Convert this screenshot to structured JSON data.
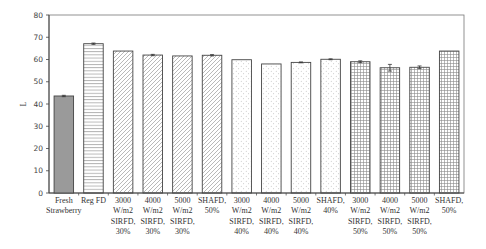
{
  "chart_data": {
    "type": "bar",
    "title": "",
    "xlabel": "",
    "ylabel": "L",
    "ylim": [
      0,
      80
    ],
    "yticks": [
      0,
      10,
      20,
      30,
      40,
      50,
      60,
      70,
      80
    ],
    "grid": false,
    "legend": null,
    "categories": [
      "Fresh Strawberry",
      "Reg FD",
      "3000 W/m2 SIRFD, 30%",
      "4000 W/m2 SIRFD, 30%",
      "5000 W/m2 SIRFD, 30%",
      "SHAFD, 50%",
      "3000 W/m2 SIRFD, 40%",
      "4000 W/m2 SIRFD, 40%",
      "5000 W/m2 SIRFD, 40%",
      "SHAFD, 40%",
      "3000 W/m2 SIRFD, 50%",
      "4000 W/m2 SIRFD, 50%",
      "5000 W/m2 SIRFD, 50%",
      "SHAFD, 50%"
    ],
    "category_lines": [
      [
        "Fresh",
        "Strawberry"
      ],
      [
        "Reg FD"
      ],
      [
        "3000",
        "W/m2",
        "SIRFD,",
        "30%"
      ],
      [
        "4000",
        "W/m2",
        "SIRFD,",
        "30%"
      ],
      [
        "5000",
        "W/m2",
        "SIRFD,",
        "30%"
      ],
      [
        "SHAFD,",
        "50%"
      ],
      [
        "3000",
        "W/m2",
        "SIRFD,",
        "40%"
      ],
      [
        "4000",
        "W/m2",
        "SIRFD,",
        "40%"
      ],
      [
        "5000",
        "W/m2",
        "SIRFD,",
        "40%"
      ],
      [
        "SHAFD,",
        "40%"
      ],
      [
        "3000",
        "W/m2",
        "SIRFD,",
        "50%"
      ],
      [
        "4000",
        "W/m2",
        "SIRFD,",
        "50%"
      ],
      [
        "5000",
        "W/m2",
        "SIRFD,",
        "50%"
      ],
      [
        "SHAFD,",
        "50%"
      ]
    ],
    "values": [
      43.6,
      67.1,
      63.8,
      62.0,
      61.6,
      61.9,
      59.9,
      58.0,
      58.7,
      60.1,
      59.0,
      56.3,
      56.5,
      63.8
    ],
    "errors": [
      0.3,
      0.3,
      0.0,
      0.3,
      0.0,
      0.3,
      0.0,
      0.0,
      0.2,
      0.2,
      0.4,
      1.5,
      0.6,
      0.0
    ],
    "patterns": [
      "solid",
      "horizontal",
      "diagonal",
      "diagonal",
      "diagonal",
      "diagonal",
      "dots",
      "dots",
      "dots",
      "dots",
      "grid",
      "grid",
      "grid",
      "grid"
    ]
  },
  "colors": {
    "axis": "#444444",
    "bar_stroke": "#444444",
    "solid_fill": "#9a9a9a",
    "pattern_stroke": "#8a8a8a"
  }
}
